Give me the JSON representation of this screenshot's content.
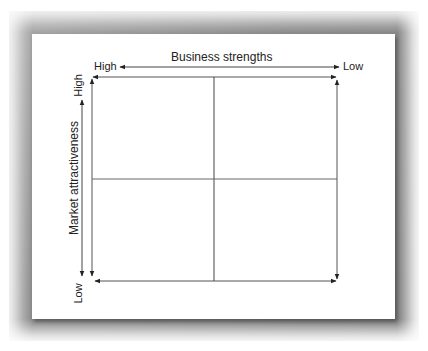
{
  "diagram": {
    "type": "2x2 matrix",
    "x_axis": {
      "title": "Business strengths",
      "left_label": "High",
      "right_label": "Low"
    },
    "y_axis": {
      "title": "Market attractiveness",
      "top_label": "High",
      "bottom_label": "Low"
    },
    "quadrants": 4,
    "line_color": "#333333"
  }
}
